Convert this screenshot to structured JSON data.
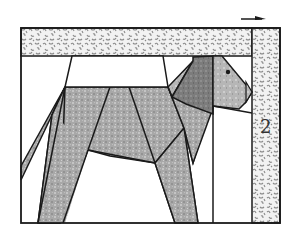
{
  "figure": {
    "piece_label": "2",
    "arrow_direction": "right",
    "colors": {
      "outline": "#1a1a1a",
      "background": "#ffffff",
      "body_fill": "#a8a8a8",
      "ear_fill": "#7a7a7a",
      "head_fill": "#b4b4b4",
      "border_speckle": "#8a8a8a",
      "border_base": "#f2f2f2"
    }
  }
}
